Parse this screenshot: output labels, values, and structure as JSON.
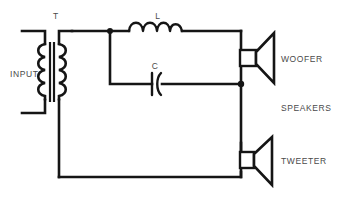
{
  "diagram": {
    "background_color": "#ffffff",
    "line_color": "#151515",
    "text_color": "#4a4a4a"
  },
  "labels": {
    "transformer": "T",
    "input": "INPUT",
    "inductor": "L",
    "capacitor": "C",
    "woofer": "WOOFER",
    "speakers": "SPEAKERS",
    "tweeter": "TWEETER"
  },
  "components": [
    {
      "id": "T",
      "name": "transformer",
      "label": "T"
    },
    {
      "id": "L",
      "name": "inductor",
      "label": "L"
    },
    {
      "id": "C",
      "name": "capacitor",
      "label": "C"
    },
    {
      "id": "SPK1",
      "name": "woofer-speaker",
      "label": "WOOFER"
    },
    {
      "id": "SPK2",
      "name": "tweeter-speaker",
      "label": "TWEETER"
    }
  ],
  "terminals": [
    {
      "name": "input-terminal-top"
    },
    {
      "name": "input-terminal-bottom"
    }
  ],
  "junctions": [
    {
      "name": "junction-inductor-input"
    },
    {
      "name": "junction-woofer-return"
    }
  ]
}
